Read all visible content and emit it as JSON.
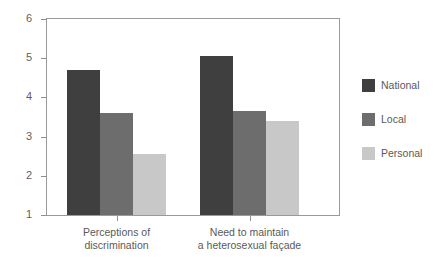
{
  "chart_data": {
    "type": "bar",
    "title": "",
    "subtitle": "",
    "xlabel": "",
    "ylabel": "",
    "categories": [
      "Perceptions of discrimination",
      "Need to maintain a heterosexual façade"
    ],
    "category_lines": [
      [
        "Perceptions of",
        "discrimination"
      ],
      [
        "Need to maintain",
        "a heterosexual façade"
      ]
    ],
    "series": [
      {
        "name": "National",
        "color": "#3f3f3f",
        "values": [
          4.7,
          5.05
        ]
      },
      {
        "name": "Local",
        "color": "#6d6d6d",
        "values": [
          3.6,
          3.65
        ]
      },
      {
        "name": "Personal",
        "color": "#c8c8c8",
        "values": [
          2.55,
          3.4
        ]
      }
    ],
    "ylim": [
      1,
      6
    ],
    "y_ticks": [
      1,
      2,
      3,
      4,
      5,
      6
    ],
    "y_tick_labels": [
      "1",
      "2",
      "3",
      "4",
      "5",
      "6"
    ],
    "grid": false,
    "legend_position": "right",
    "legend_entries": [
      "National",
      "Local",
      "Personal"
    ],
    "axis_color": "#8f8f8f",
    "frame_color": "#9a9a9a",
    "background": "#ffffff"
  }
}
